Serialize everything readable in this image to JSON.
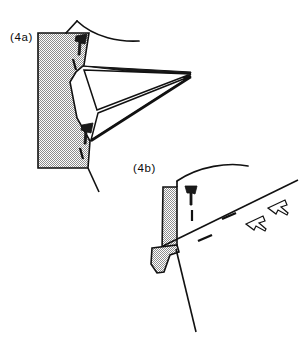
{
  "figure": {
    "background_color": "#ffffff",
    "ink_color": "#111111",
    "stipple_color": "#9a9a9a",
    "stipple_background": "#ffffff",
    "width": 302,
    "height": 346
  },
  "panels": [
    {
      "id": "4a",
      "label": "(4a)",
      "label_x": 10,
      "label_y": 41,
      "block": {
        "name": "stippled-block-4a",
        "points": "66,33 66,33 89,33 84,65 76,72 70,82 77,118 84,152 88,168 38,168 38,33",
        "description": "stippled wedge block with concave right notch"
      },
      "curve": {
        "name": "top-arc-4a",
        "path": "M 77,21 C 95,38 120,42 139,41"
      },
      "wedges": [
        {
          "name": "upper-wedge-4a",
          "points": "83,67 190,71 188,76"
        },
        {
          "name": "mid-wedge-4a",
          "points": "83,69 191,74 96,110"
        },
        {
          "name": "lower-wedge-4a",
          "points": "96,112 191,75 90,141"
        }
      ],
      "edges": [
        {
          "name": "block-top-edge-4a",
          "path": "M 66,33 L 89,33"
        },
        {
          "name": "block-right-upper-4a",
          "path": "M 89,33 L 84,65"
        },
        {
          "name": "block-notch-4a",
          "path": "M 84,65 L 76,72 L 70,82 L 77,118"
        },
        {
          "name": "block-right-lower-4a",
          "path": "M 77,118 L 90,141 L 88,168"
        },
        {
          "name": "block-bottom-edge-4a",
          "path": "M 38,168 L 88,168"
        },
        {
          "name": "block-left-edge-4a",
          "path": "M 38,33 L 38,168"
        },
        {
          "name": "tail-line-4a",
          "path": "M 88,168 L 98,190"
        },
        {
          "name": "top-corner-tick-4a",
          "path": "M 66,33 L 77,21"
        }
      ],
      "markers": [
        {
          "name": "shear-marker-upper-4a",
          "flag": "77,38 86,36 84,45 81,44 80,53 78,53 79,43 76,42",
          "dash": "M 74,58 L 77,69",
          "angle": -8
        },
        {
          "name": "shear-marker-lower-4a",
          "flag": "83,126 92,124 90,133 87,132 86,141 84,141 85,131 82,130",
          "dash": "M 81,147 L 84,158",
          "angle": -8
        }
      ]
    },
    {
      "id": "4b",
      "label": "(4b)",
      "label_x": 133,
      "label_y": 172,
      "block": {
        "name": "stippled-block-4b",
        "points": "177,182 177,182 175,184 175,234 163,237 163,255 155,256 170,252 177,250 177,182",
        "description": "stippled column block with offset lower lobe"
      },
      "block_main": {
        "name": "stippled-block-main-4b",
        "points": "176,183 176,183 177,183 177,250 163,253 163,186"
      },
      "block_lower": {
        "name": "stippled-block-lobe-4b",
        "points": "156,246 176,243 178,250 170,254 165,270 158,272 152,264 152,249"
      },
      "curve": {
        "name": "top-arc-4b",
        "path": "M 177,181 C 197,166 228,163 247,166"
      },
      "lines": [
        {
          "name": "fault-line-4b",
          "path": "M 165,245 L 297,181"
        },
        {
          "name": "slip-line-4b",
          "path": "M 176,250 L 196,330"
        },
        {
          "name": "block-top-tick-4b",
          "path": "M 163,186 L 177,181"
        }
      ],
      "markers": [
        {
          "name": "shear-marker-vertical-4b",
          "flag": "186,186 196,186 194,194 191,193 191,203 189,203 189,193 186,193",
          "dash": "M 192,208 L 192,219",
          "angle": 0
        },
        {
          "name": "shear-marker-inclined-lower-4b",
          "flag": "248,222 262,216 264,222 260,223 266,228 265,230 258,225 257,229",
          "dash": "M 200,240 L 212,236",
          "angle": -26
        },
        {
          "name": "shear-marker-inclined-upper-4b",
          "flag": "269,206 283,200 285,206 281,207 287,212 286,214 279,209 278,213",
          "dash": "M 224,217 L 236,213",
          "angle": -26
        }
      ]
    }
  ]
}
